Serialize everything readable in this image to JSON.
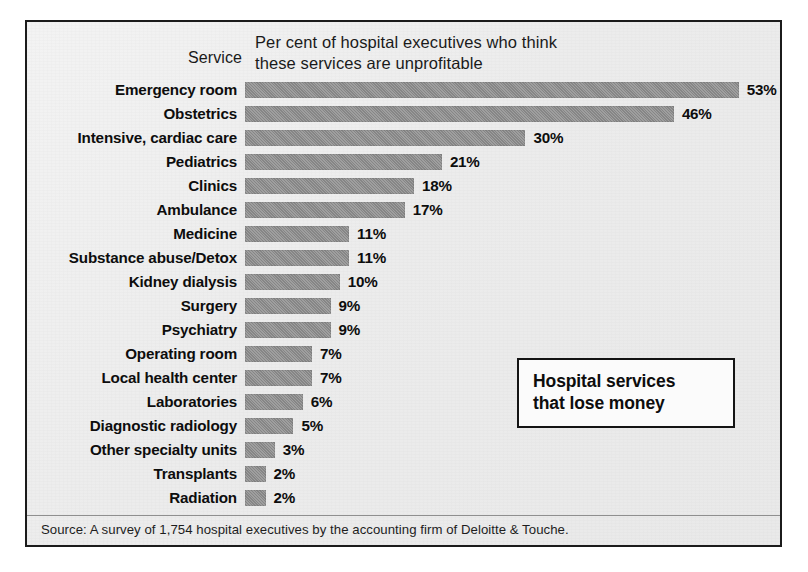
{
  "chart_data": {
    "type": "bar",
    "orientation": "horizontal",
    "title": "Hospital services that lose money",
    "caption_lines": [
      "Per cent of hospital executives who think",
      "these services are unprofitable"
    ],
    "category_axis_label": "Service",
    "xlabel": "",
    "ylabel": "Service",
    "value_suffix": "%",
    "xlim": [
      0,
      53
    ],
    "grid": false,
    "legend": null,
    "categories": [
      "Emergency room",
      "Obstetrics",
      "Intensive, cardiac care",
      "Pediatrics",
      "Clinics",
      "Ambulance",
      "Medicine",
      "Substance abuse/Detox",
      "Kidney dialysis",
      "Surgery",
      "Psychiatry",
      "Operating room",
      "Local health center",
      "Laboratories",
      "Diagnostic radiology",
      "Other specialty units",
      "Transplants",
      "Radiation"
    ],
    "values": [
      53,
      46,
      30,
      21,
      18,
      17,
      11,
      11,
      10,
      9,
      9,
      7,
      7,
      6,
      5,
      3,
      2,
      2
    ],
    "value_labels": [
      "53%",
      "46%",
      "30%",
      "21%",
      "18%",
      "17%",
      "11%",
      "11%",
      "10%",
      "9%",
      "9%",
      "7%",
      "7%",
      "6%",
      "5%",
      "3%",
      "2%",
      "2%"
    ],
    "source": "Source: A survey of 1,754 hospital executives by the accounting firm of Deloitte & Touche.",
    "colors": {
      "bar": "#8d8d8d",
      "background": "#ededed",
      "text": "#0d0d0d",
      "frame": "#1b1b1b"
    }
  },
  "header": {
    "service_label": "Service",
    "caption_line_1": "Per cent of hospital executives who think",
    "caption_line_2": "these services are unprofitable"
  },
  "callout": {
    "line_1": "Hospital services",
    "line_2": "that lose money"
  },
  "footer": {
    "source": "Source: A survey of 1,754 hospital executives by the accounting firm of Deloitte & Touche."
  }
}
